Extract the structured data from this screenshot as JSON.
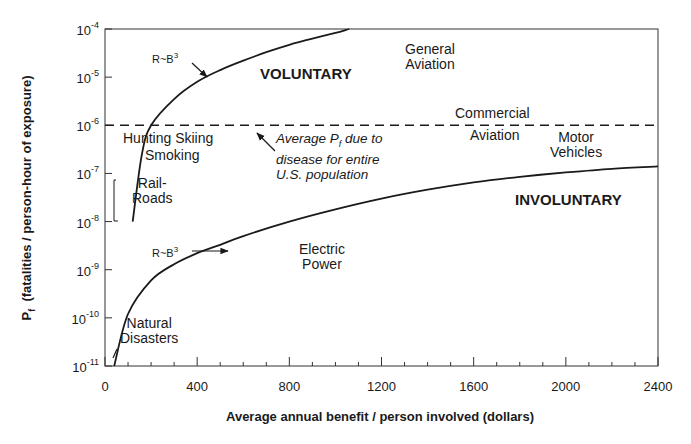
{
  "chart_data": {
    "type": "line",
    "title": "",
    "xlabel": "Average annual benefit / person involved (dollars)",
    "ylabel": "Pf (fatalities / person-hour of exposure)",
    "ylabel_main": "P",
    "ylabel_sub": "f",
    "ylabel_rest": "(fatalities / person-hour of exposure)",
    "xlim": [
      0,
      2400
    ],
    "ylim": [
      1e-11,
      0.0001
    ],
    "yscale": "log",
    "grid": false,
    "x_ticks": [
      "0",
      "400",
      "800",
      "1200",
      "1600",
      "2000",
      "2400"
    ],
    "y_ticks": [
      {
        "base": "10",
        "exp": "-4"
      },
      {
        "base": "10",
        "exp": "-5"
      },
      {
        "base": "10",
        "exp": "-6"
      },
      {
        "base": "10",
        "exp": "-7"
      },
      {
        "base": "10",
        "exp": "-8"
      },
      {
        "base": "10",
        "exp": "-9"
      },
      {
        "base": "10",
        "exp": "-10"
      },
      {
        "base": "10",
        "exp": "-11"
      }
    ],
    "series": [
      {
        "name": "Voluntary boundary (R~B^3)",
        "style": "solid",
        "x": [
          120,
          160,
          200,
          300,
          400,
          500,
          600,
          700,
          800,
          900,
          1000,
          1060
        ],
        "y": [
          1e-08,
          2.5e-07,
          1e-06,
          3.5e-06,
          8e-06,
          1.4e-05,
          2.2e-05,
          3.3e-05,
          4.7e-05,
          6.3e-05,
          8.3e-05,
          0.0001
        ]
      },
      {
        "name": "Involuntary boundary (R~B^3)",
        "style": "solid",
        "x": [
          40,
          100,
          200,
          300,
          400,
          500,
          600,
          800,
          1000,
          1200,
          1400,
          1600,
          1800,
          2000,
          2200,
          2400
        ],
        "y": [
          1e-11,
          1.2e-10,
          6e-10,
          1.3e-09,
          2.2e-09,
          3.3e-09,
          5e-09,
          1e-08,
          1.8e-08,
          3e-08,
          4.6e-08,
          6.5e-08,
          8.5e-08,
          1.05e-07,
          1.25e-07,
          1.4e-07
        ]
      },
      {
        "name": "Average Pf due to disease for entire U.S. population",
        "style": "dashed",
        "x": [
          0,
          2400
        ],
        "y": [
          1e-06,
          1e-06
        ]
      }
    ],
    "annotations": {
      "voluntary": "VOLUNTARY",
      "involuntary": "INVOLUNTARY",
      "rb_top": "R~B",
      "rb_top_exp": "3",
      "rb_bottom": "R~B",
      "rb_bottom_exp": "3",
      "general_aviation": [
        "General",
        "Aviation"
      ],
      "commercial_aviation_1": "Commercial",
      "commercial_aviation_2": "Aviation",
      "motor_vehicles": [
        "Motor",
        "Vehicles"
      ],
      "hunting": "Hunting Skiing",
      "smoking": "Smoking",
      "railroads": [
        "Rail-",
        "Roads"
      ],
      "electric_power": [
        "Electric",
        "Power"
      ],
      "natural_disasters": [
        "Natural",
        "Disasters"
      ],
      "disease_note": [
        "Average P",
        "f",
        " due to",
        "disease for entire",
        "U.S. population"
      ]
    }
  }
}
